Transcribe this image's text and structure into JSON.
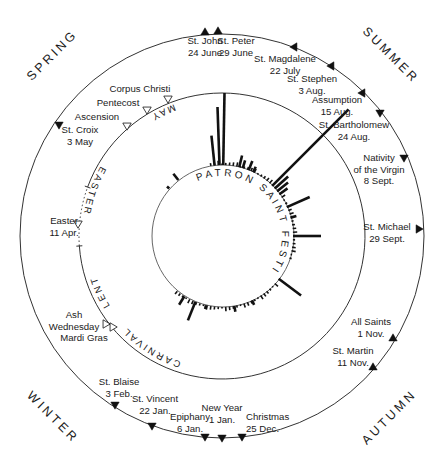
{
  "title": "Patron Saint Festivals",
  "seasons": [
    {
      "label": "SPRING",
      "x": 55,
      "y": 58,
      "rotate": -45
    },
    {
      "label": "SUMMER",
      "x": 388,
      "y": 58,
      "rotate": 45
    },
    {
      "label": "WINTER",
      "x": 50,
      "y": 420,
      "rotate": 45
    },
    {
      "label": "AUTUMN",
      "x": 392,
      "y": 420,
      "rotate": -45
    }
  ],
  "fixed_feasts": [
    {
      "name": "St. John",
      "date": "24 June",
      "mx": 205,
      "my": 32,
      "dir": "up",
      "lx": 205,
      "ly": 44,
      "anchor": "middle"
    },
    {
      "name": "St. Peter",
      "date": "29 June",
      "mx": 218,
      "my": 31,
      "dir": "up",
      "lx": 236,
      "ly": 44,
      "anchor": "middle"
    },
    {
      "name": "St. Magdalene",
      "date": "22 July",
      "mx": 294,
      "my": 47,
      "dir": "left",
      "lx": 285,
      "ly": 62,
      "anchor": "middle"
    },
    {
      "name": "St. Stephen",
      "date": "3 Aug.",
      "mx": 331,
      "my": 66,
      "dir": "left",
      "lx": 312,
      "ly": 82,
      "anchor": "middle"
    },
    {
      "name": "Assumption",
      "date": "15 Aug.",
      "mx": 362,
      "my": 93,
      "dir": "left",
      "lx": 337,
      "ly": 103,
      "anchor": "middle"
    },
    {
      "name": "St. Bartholomew",
      "date": "24 Aug.",
      "mx": 380,
      "my": 113,
      "dir": "down",
      "lx": 354,
      "ly": 128,
      "anchor": "middle"
    },
    {
      "name": "Nativity",
      "name2": "of the Virgin",
      "date": "8 Sept.",
      "mx": 404,
      "my": 158,
      "dir": "down",
      "lx": 379,
      "ly": 161,
      "anchor": "middle"
    },
    {
      "name": "St. Michael",
      "date": "29 Sept.",
      "mx": 419,
      "my": 229,
      "dir": "right",
      "lx": 387,
      "ly": 230,
      "anchor": "middle"
    },
    {
      "name": "All Saints",
      "date": "1 Nov.",
      "mx": 393,
      "my": 338,
      "dir": "up",
      "lx": 371,
      "ly": 325,
      "anchor": "middle"
    },
    {
      "name": "St. Martin",
      "date": "11 Nov.",
      "mx": 373,
      "my": 367,
      "dir": "up",
      "lx": 353,
      "ly": 354,
      "anchor": "middle"
    },
    {
      "name": "Christmas",
      "date": "25 Dec.",
      "mx": 242,
      "my": 437,
      "dir": "down",
      "lx": 246,
      "ly": 420,
      "anchor": "start"
    },
    {
      "name": "New Year",
      "date": "1 Jan.",
      "mx": 222,
      "my": 438,
      "dir": "down",
      "lx": 222,
      "ly": 411,
      "anchor": "middle"
    },
    {
      "name": "Epiphany",
      "date": "6 Jan.",
      "mx": 205,
      "my": 437,
      "dir": "down",
      "lx": 190,
      "ly": 420,
      "anchor": "middle"
    },
    {
      "name": "St. Vincent",
      "date": "22 Jan.",
      "mx": 152,
      "my": 426,
      "dir": "down",
      "lx": 155,
      "ly": 402,
      "anchor": "middle"
    },
    {
      "name": "St. Blaise",
      "date": "3 Feb.",
      "mx": 115,
      "my": 405,
      "dir": "down",
      "lx": 119,
      "ly": 385,
      "anchor": "middle"
    },
    {
      "name": "St. Croix",
      "date": "3 May",
      "mx": 59,
      "my": 125,
      "dir": "down",
      "lx": 80,
      "ly": 133,
      "anchor": "middle"
    }
  ],
  "movable_feasts": [
    {
      "name": "Corpus Christi",
      "mx": 168,
      "my": 99,
      "lx": 140,
      "ly": 92,
      "anchor": "middle"
    },
    {
      "name": "Pentecost",
      "mx": 147,
      "my": 110,
      "lx": 118,
      "ly": 106,
      "anchor": "middle"
    },
    {
      "name": "Ascension",
      "mx": 127,
      "my": 126,
      "lx": 97,
      "ly": 120,
      "anchor": "middle"
    },
    {
      "name": "Easter",
      "date": "11 Apr.",
      "mx": 78,
      "my": 224,
      "lx": 64,
      "ly": 224,
      "anchor": "middle"
    },
    {
      "name": "Ash",
      "name2": "Wednesday",
      "mx": 106,
      "my": 324,
      "lx": 74,
      "ly": 318,
      "anchor": "middle"
    },
    {
      "name": "Mardi Gras",
      "mx": 113,
      "my": 327,
      "lx": 84,
      "ly": 341,
      "anchor": "middle"
    }
  ],
  "periods": [
    {
      "label": "MAY",
      "start_deg": 228,
      "end_deg": 240
    },
    {
      "label": "EASTER",
      "start_deg": 176,
      "end_deg": 200
    },
    {
      "label": "LENT",
      "start_deg": 148,
      "end_deg": 165
    },
    {
      "label": "CARNIVAL",
      "start_deg": 108,
      "end_deg": 138
    }
  ],
  "chart_data": {
    "type": "radial-bar",
    "title": "PATRON SAINT FESTIVALS",
    "bars": [
      {
        "angle_deg": 271,
        "length": 72
      },
      {
        "angle_deg": 268,
        "length": 58
      },
      {
        "angle_deg": 264,
        "length": 30
      },
      {
        "angle_deg": 284,
        "length": 12
      },
      {
        "angle_deg": 287,
        "length": 8
      },
      {
        "angle_deg": 292,
        "length": 10
      },
      {
        "angle_deg": 296,
        "length": 6
      },
      {
        "angle_deg": 315,
        "length": 108
      },
      {
        "angle_deg": 318,
        "length": 18
      },
      {
        "angle_deg": 321,
        "length": 14
      },
      {
        "angle_deg": 324,
        "length": 10
      },
      {
        "angle_deg": 336,
        "length": 25
      },
      {
        "angle_deg": 345,
        "length": 6
      },
      {
        "angle_deg": 360,
        "length": 28
      },
      {
        "angle_deg": 37,
        "length": 28
      },
      {
        "angle_deg": 65,
        "length": 5
      },
      {
        "angle_deg": 80,
        "length": 6
      },
      {
        "angle_deg": 103,
        "length": 4
      },
      {
        "angle_deg": 112,
        "length": 20
      },
      {
        "angle_deg": 122,
        "length": 10
      },
      {
        "angle_deg": 232,
        "length": 8
      },
      {
        "angle_deg": 222,
        "length": 3
      }
    ]
  }
}
